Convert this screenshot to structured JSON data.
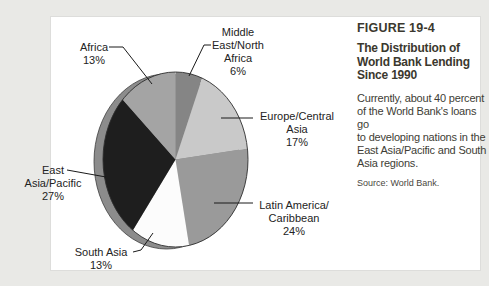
{
  "page": {
    "background_color": "#e9e9e6",
    "panel_color": "#ffffff"
  },
  "caption": {
    "figure_number": "FIGURE 19-4",
    "title_lines": [
      "The Distribution of",
      "World Bank Lending",
      "Since 1990"
    ],
    "body_lines": [
      "Currently, about 40 percent",
      "of the World Bank's loans go",
      "to developing nations in the",
      "East Asia/Pacific and South",
      "Asia regions."
    ],
    "source": "Source: World Bank."
  },
  "chart_data": {
    "type": "pie",
    "title": "The Distribution of World Bank Lending Since 1990",
    "start_angle_deg": 0,
    "direction": "clockwise",
    "style": "3d-offset-ellipse",
    "outline_color": "#2e2e2e",
    "rim_color": "#8c8c8c",
    "slices": [
      {
        "label": "Middle East/North Africa",
        "value": 6,
        "color": "#858585"
      },
      {
        "label": "Europe/Central Asia",
        "value": 17,
        "color": "#c9c9c9"
      },
      {
        "label": "Latin America/Caribbean",
        "value": 24,
        "color": "#9a9a9a"
      },
      {
        "label": "South Asia",
        "value": 13,
        "color": "#fcfcfc"
      },
      {
        "label": "East Asia/Pacific",
        "value": 27,
        "color": "#1e1e1e"
      },
      {
        "label": "Africa",
        "value": 13,
        "color": "#a4a4a4"
      }
    ]
  },
  "labels": {
    "africa": {
      "lines": [
        "Africa",
        "13%"
      ]
    },
    "middle_east": {
      "lines": [
        "Middle",
        "East/North",
        "Africa",
        "6%"
      ]
    },
    "europe": {
      "lines": [
        "Europe/Central",
        "Asia",
        "17%"
      ]
    },
    "latin": {
      "lines": [
        "Latin America/",
        "Caribbean",
        "24%"
      ]
    },
    "south_asia": {
      "lines": [
        "South Asia",
        "13%"
      ]
    },
    "east_asia": {
      "lines": [
        "East",
        "Asia/Pacific",
        "27%"
      ]
    }
  }
}
